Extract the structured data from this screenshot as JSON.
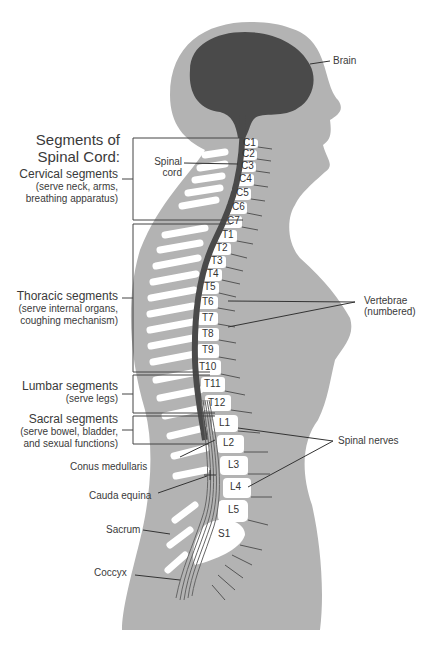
{
  "title": {
    "line1": "Segments of",
    "line2": "Spinal Cord:"
  },
  "segments": [
    {
      "name": "Cervical segments",
      "desc1": "(serve neck, arms,",
      "desc2": "breathing apparatus)"
    },
    {
      "name": "Thoracic segments",
      "desc1": "(serve internal organs,",
      "desc2": "coughing mechanism)"
    },
    {
      "name": "Lumbar segments",
      "desc1": "(serve legs)",
      "desc2": ""
    },
    {
      "name": "Sacral segments",
      "desc1": "(serve bowel, bladder,",
      "desc2": "and sexual functions)"
    }
  ],
  "labels": {
    "brain": "Brain",
    "spinal_cord_1": "Spinal",
    "spinal_cord_2": "cord",
    "vertebrae_1": "Vertebrae",
    "vertebrae_2": "(numbered)",
    "spinal_nerves": "Spinal nerves",
    "conus": "Conus medullaris",
    "cauda": "Cauda equina",
    "sacrum": "Sacrum",
    "coccyx": "Coccyx"
  },
  "vertebrae": [
    "C1",
    "C2",
    "C3",
    "C4",
    "C5",
    "C6",
    "C7",
    "T1",
    "T2",
    "T3",
    "T4",
    "T5",
    "T6",
    "T7",
    "T8",
    "T9",
    "T10",
    "T11",
    "T12",
    "L1",
    "L2",
    "L3",
    "L4",
    "L5",
    "S1"
  ],
  "colors": {
    "body": "#b3b3b3",
    "brain": "#4a4a4a",
    "cord": "#555555",
    "bone": "#ffffff",
    "line": "#333333"
  }
}
